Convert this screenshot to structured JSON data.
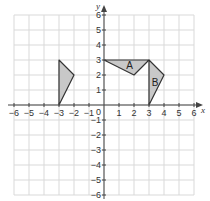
{
  "diagram": {
    "type": "coordinate-grid",
    "x_axis": {
      "label": "x",
      "min": -6,
      "max": 6,
      "ticks": [
        "-6",
        "-5",
        "-4",
        "-3",
        "-2",
        "-1",
        "1",
        "2",
        "3",
        "4",
        "5",
        "6"
      ]
    },
    "y_axis": {
      "label": "y",
      "min": -6,
      "max": 6,
      "ticks": [
        "6",
        "5",
        "4",
        "3",
        "2",
        "1",
        "-1",
        "-2",
        "-3",
        "-4",
        "-5",
        "-6"
      ]
    },
    "origin_label": "0",
    "colors": {
      "grid": "#d9d9d9",
      "axis": "#444444",
      "shape_fill": "#c8c8c8",
      "shape_stroke": "#333333"
    },
    "shapes": [
      {
        "name": "A",
        "label": "A",
        "vertices": [
          [
            0,
            3
          ],
          [
            3,
            3
          ],
          [
            2,
            2
          ]
        ],
        "label_pos": [
          1.7,
          2.6
        ]
      },
      {
        "name": "B",
        "label": "B",
        "vertices": [
          [
            3,
            3
          ],
          [
            4,
            2
          ],
          [
            3,
            0
          ]
        ],
        "label_pos": [
          3.4,
          1.5
        ]
      },
      {
        "name": "unlabeled",
        "label": "",
        "vertices": [
          [
            -3,
            3
          ],
          [
            -2,
            2
          ],
          [
            -3,
            0
          ]
        ]
      }
    ]
  }
}
